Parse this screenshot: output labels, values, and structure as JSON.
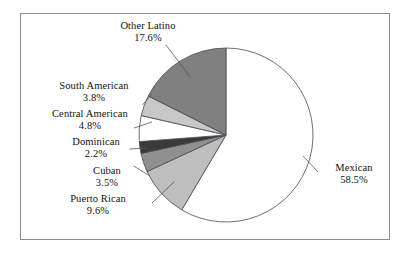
{
  "figure": {
    "kind": "pie-chart-figure",
    "frame_color": "#8c8c94",
    "background": "#ffffff",
    "text_color": "#111111",
    "leader_color": "#55555c"
  },
  "chart_data": {
    "type": "pie",
    "title": "",
    "xlabel": "",
    "ylabel": "",
    "grid": false,
    "legend_position": "none",
    "labels_outside": true,
    "start_angle_deg": 0,
    "direction": "clockwise",
    "units": "%",
    "total": 100.0,
    "categories": [
      "Mexican",
      "Puerto Rican",
      "Cuban",
      "Dominican",
      "Central American",
      "South American",
      "Other Latino"
    ],
    "values": [
      58.5,
      9.6,
      3.5,
      2.2,
      4.8,
      3.8,
      17.6
    ],
    "value_labels": [
      "58.5%",
      "9.6%",
      "3.5%",
      "2.2%",
      "4.8%",
      "3.8%",
      "17.6%"
    ],
    "colors": [
      "#ffffff",
      "#bebebe",
      "#909090",
      "#3a3a3a",
      "#ffffff",
      "#c8c8c8",
      "#808080"
    ],
    "slices": [
      {
        "name": "Mexican",
        "value": 58.5,
        "value_label": "58.5%",
        "color": "#ffffff"
      },
      {
        "name": "Puerto Rican",
        "value": 9.6,
        "value_label": "9.6%",
        "color": "#bebebe"
      },
      {
        "name": "Cuban",
        "value": 3.5,
        "value_label": "3.5%",
        "color": "#909090"
      },
      {
        "name": "Dominican",
        "value": 2.2,
        "value_label": "2.2%",
        "color": "#3a3a3a"
      },
      {
        "name": "Central American",
        "value": 4.8,
        "value_label": "4.8%",
        "color": "#ffffff"
      },
      {
        "name": "South American",
        "value": 3.8,
        "value_label": "3.8%",
        "color": "#c8c8c8"
      },
      {
        "name": "Other Latino",
        "value": 17.6,
        "value_label": "17.6%",
        "color": "#808080"
      }
    ]
  },
  "annotations": {
    "other_latino": {
      "name": "Other Latino",
      "pct": "17.6%"
    },
    "south_american": {
      "name": "South American",
      "pct": "3.8%"
    },
    "central_american": {
      "name": "Central American",
      "pct": "4.8%"
    },
    "dominican": {
      "name": "Dominican",
      "pct": "2.2%"
    },
    "cuban": {
      "name": "Cuban",
      "pct": "3.5%"
    },
    "puerto_rican": {
      "name": "Puerto Rican",
      "pct": "9.6%"
    },
    "mexican": {
      "name": "Mexican",
      "pct": "58.5%"
    }
  }
}
